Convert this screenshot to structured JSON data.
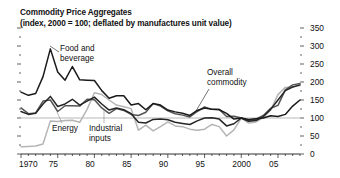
{
  "figure": {
    "title": "Commodity Price Aggregates",
    "subtitle": "(index, 2000 = 100; deflated by manufactures unit value)"
  },
  "chart_data": {
    "type": "line",
    "title": "Commodity Price Aggregates",
    "subtitle": "(index, 2000 = 100; deflated by manufactures unit value)",
    "xlabel": "",
    "ylabel": "",
    "xlim": [
      1970,
      2008
    ],
    "ylim": [
      0,
      350
    ],
    "yticks": [
      0,
      50,
      100,
      150,
      200,
      250,
      300,
      350
    ],
    "ytick_labels": [
      "0",
      "50",
      "100",
      "150",
      "200",
      "250",
      "300",
      "350"
    ],
    "y_minor_tick_step": 25,
    "xticks": [
      1970,
      1975,
      1980,
      1985,
      1990,
      1995,
      2000,
      2005
    ],
    "xtick_labels": [
      "1970",
      "75",
      "80",
      "85",
      "90",
      "95",
      "2000",
      "05"
    ],
    "x_minor_tick_step": 1,
    "grid": "single horizontal reference line at y=100",
    "gridline_value": 100,
    "legend": "inline labels with leader lines",
    "legend_position": "inline",
    "x": [
      1970,
      1971,
      1972,
      1973,
      1974,
      1975,
      1976,
      1977,
      1978,
      1979,
      1980,
      1981,
      1982,
      1983,
      1984,
      1985,
      1986,
      1987,
      1988,
      1989,
      1990,
      1991,
      1992,
      1993,
      1994,
      1995,
      1996,
      1997,
      1998,
      1999,
      2000,
      2001,
      2002,
      2003,
      2004,
      2005,
      2006,
      2007,
      2008
    ],
    "series": [
      {
        "name": "Food and beverage",
        "label": "Food and beverage",
        "color": "#1a1a1a",
        "width": 1.5,
        "values": [
          172,
          163,
          168,
          215,
          292,
          228,
          205,
          243,
          206,
          205,
          204,
          176,
          155,
          162,
          162,
          136,
          140,
          123,
          140,
          136,
          122,
          117,
          113,
          107,
          121,
          128,
          124,
          123,
          113,
          97,
          100,
          96,
          98,
          100,
          106,
          104,
          110,
          133,
          150
        ]
      },
      {
        "name": "Overall commodity",
        "label": "Overall commodity",
        "color": "#262626",
        "width": 1.5,
        "values": [
          118,
          110,
          113,
          139,
          160,
          132,
          139,
          152,
          136,
          147,
          158,
          139,
          122,
          128,
          123,
          112,
          88,
          86,
          96,
          97,
          95,
          88,
          85,
          82,
          92,
          100,
          101,
          97,
          78,
          84,
          100,
          91,
          93,
          104,
          124,
          150,
          176,
          186,
          192
        ]
      },
      {
        "name": "Industrial inputs",
        "label": "Industrial inputs",
        "color": "#555555",
        "width": 1.5,
        "values": [
          128,
          112,
          114,
          147,
          150,
          118,
          134,
          134,
          133,
          152,
          151,
          128,
          113,
          126,
          121,
          110,
          107,
          116,
          140,
          133,
          120,
          112,
          108,
          103,
          118,
          131,
          124,
          124,
          104,
          105,
          100,
          92,
          97,
          107,
          127,
          135,
          178,
          192,
          196
        ]
      },
      {
        "name": "Energy",
        "label": "Energy",
        "color": "#b5b5b5",
        "width": 1.5,
        "values": [
          20,
          21,
          22,
          28,
          92,
          90,
          93,
          94,
          88,
          124,
          170,
          165,
          150,
          136,
          131,
          126,
          66,
          80,
          64,
          76,
          89,
          78,
          76,
          69,
          66,
          69,
          82,
          76,
          50,
          67,
          100,
          86,
          89,
          101,
          122,
          165,
          185,
          186,
          190
        ]
      }
    ],
    "annotations": [
      {
        "text": "Food and beverage",
        "x": 1975.8,
        "y": 262
      },
      {
        "text": "Overall commodity",
        "x": 1996.5,
        "y": 200
      },
      {
        "text": "Energy",
        "x": 1974.5,
        "y": 55
      },
      {
        "text": "Industrial inputs",
        "x": 1979.5,
        "y": 55
      }
    ]
  },
  "labels": {
    "food": "Food and",
    "food2": "beverage",
    "overall": "Overall",
    "overall2": "commodity",
    "energy": "Energy",
    "industrial": "Industrial",
    "industrial2": "inputs"
  },
  "axes": {
    "x": [
      "1970",
      "75",
      "80",
      "85",
      "90",
      "95",
      "2000",
      "05"
    ],
    "y": [
      "350",
      "300",
      "250",
      "200",
      "150",
      "100",
      "50",
      "0"
    ]
  }
}
